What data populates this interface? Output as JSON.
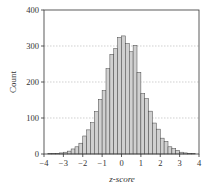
{
  "chart_data": {
    "type": "bar",
    "title": "",
    "xlabel": "z-score",
    "ylabel": "Count",
    "xlim": [
      -4,
      4
    ],
    "ylim": [
      0,
      400
    ],
    "x_ticks": [
      "−4",
      "−3",
      "−2",
      "−1",
      "0",
      "1",
      "2",
      "3",
      "4"
    ],
    "y_ticks": [
      "0",
      "100",
      "200",
      "300",
      "400"
    ],
    "grid": "horizontal dotted",
    "legend": null,
    "bin_width": 0.2,
    "x": [
      -3.7,
      -3.5,
      -3.3,
      -3.1,
      -2.9,
      -2.7,
      -2.5,
      -2.3,
      -2.1,
      -1.9,
      -1.7,
      -1.5,
      -1.3,
      -1.1,
      -0.9,
      -0.7,
      -0.5,
      -0.3,
      -0.1,
      0.1,
      0.3,
      0.5,
      0.7,
      0.9,
      1.1,
      1.3,
      1.5,
      1.7,
      1.9,
      2.1,
      2.3,
      2.5,
      2.7,
      2.9,
      3.1,
      3.3,
      3.5,
      3.7
    ],
    "values": [
      1,
      2,
      2,
      3,
      5,
      8,
      14,
      20,
      30,
      50,
      67,
      87,
      118,
      152,
      176,
      237,
      277,
      293,
      324,
      328,
      307,
      284,
      302,
      227,
      168,
      154,
      119,
      86,
      69,
      44,
      35,
      20,
      15,
      10,
      5,
      3,
      2,
      1
    ],
    "bar_color": "#d0d0d0",
    "bar_edge_color": "#444444"
  }
}
